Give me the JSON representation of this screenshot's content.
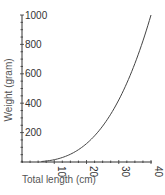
{
  "chart_data": {
    "type": "line",
    "title": "",
    "xlabel": "Total length (cm)",
    "ylabel": "Weight (gram)",
    "xlim": [
      0,
      40
    ],
    "ylim": [
      0,
      1000
    ],
    "x_ticks": [
      10,
      20,
      30,
      40
    ],
    "y_ticks": [
      200,
      400,
      600,
      800,
      1000
    ],
    "grid": false,
    "legend": null,
    "series": [
      {
        "name": "Length-weight relationship",
        "x": [
          0,
          5,
          10,
          15,
          20,
          25,
          30,
          35,
          40
        ],
        "values": [
          0,
          2,
          16,
          53,
          125,
          244,
          422,
          670,
          1000
        ]
      }
    ],
    "line_color": "#444444"
  }
}
